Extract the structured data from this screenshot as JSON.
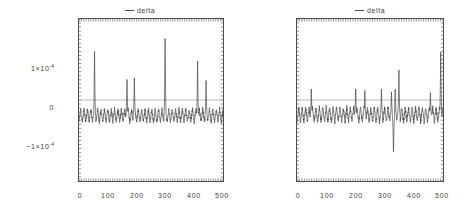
{
  "figure": {
    "panel_count": 2,
    "background_color": "#ffffff",
    "axis_color": "#4d4d4d",
    "trace_color": "#3a3a3a",
    "zeroline_color": "#9a9a9a"
  },
  "panels": [
    {
      "id": "left",
      "legend_label": "delta",
      "legend_marker": "line-swatch",
      "y_tick_labels": [
        "1×10",
        "0",
        "−1×10"
      ],
      "y_tick_exponents": [
        "-4",
        "",
        "-4"
      ],
      "x_tick_labels": [
        "0",
        "100",
        "200",
        "300",
        "400",
        "500"
      ]
    },
    {
      "id": "right",
      "legend_label": "delta",
      "legend_marker": "line-swatch",
      "y_tick_labels": [
        "1×10",
        "0",
        "−1×10"
      ],
      "y_tick_exponents": [
        "-4",
        "",
        "-4"
      ],
      "x_tick_labels": [
        "0",
        "100",
        "200",
        "300",
        "400",
        "500"
      ]
    }
  ],
  "chart_data": [
    {
      "type": "line",
      "title": "delta",
      "panel": "left",
      "xlabel": "",
      "ylabel": "",
      "xlim": [
        0,
        510
      ],
      "ylim": [
        -0.00022,
        0.00022
      ],
      "grid": false,
      "legend_position": "top-center",
      "xticks": [
        0,
        100,
        200,
        300,
        400,
        500
      ],
      "yticks": [
        0.0001,
        0,
        -0.0001
      ],
      "ytick_labels": [
        "1×10⁻⁴",
        "0",
        "−1×10⁻⁴"
      ],
      "series": [
        {
          "name": "delta",
          "baseline_mean": -4.2e-05,
          "noise_amplitude": 1.8e-05,
          "noise_period": 12,
          "peaks": [
            {
              "x": 55,
              "y": 0.000132
            },
            {
              "x": 170,
              "y": 5.6e-05
            },
            {
              "x": 196,
              "y": 6e-05
            },
            {
              "x": 305,
              "y": 0.000167
            },
            {
              "x": 420,
              "y": 0.000106
            },
            {
              "x": 450,
              "y": 5.3e-05
            }
          ]
        }
      ]
    },
    {
      "type": "line",
      "title": "delta",
      "panel": "right",
      "xlabel": "",
      "ylabel": "",
      "xlim": [
        0,
        510
      ],
      "ylim": [
        -0.00022,
        0.00022
      ],
      "grid": false,
      "legend_position": "top-center",
      "xticks": [
        0,
        100,
        200,
        300,
        400,
        500
      ],
      "yticks": [
        0.0001,
        0,
        -0.0001
      ],
      "ytick_labels": [
        "1×10⁻⁴",
        "0",
        "−1×10⁻⁴"
      ],
      "series": [
        {
          "name": "delta",
          "baseline_mean": -4e-05,
          "noise_amplitude": 2e-05,
          "noise_period": 12,
          "peaks": [
            {
              "x": 50,
              "y": 3e-05
            },
            {
              "x": 205,
              "y": 3e-05
            },
            {
              "x": 237,
              "y": 2.6e-05
            },
            {
              "x": 295,
              "y": 3e-05
            },
            {
              "x": 330,
              "y": 2.2e-05
            },
            {
              "x": 343,
              "y": 3e-05
            },
            {
              "x": 356,
              "y": 8.2e-05
            },
            {
              "x": 466,
              "y": 2e-05
            },
            {
              "x": 502,
              "y": 0.00013
            }
          ],
          "dips": [
            {
              "x": 337,
              "y": -0.00014
            }
          ]
        }
      ]
    }
  ]
}
